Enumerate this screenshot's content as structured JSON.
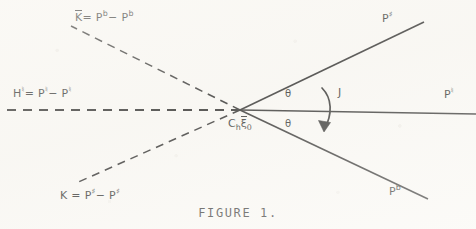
{
  "figure": {
    "caption": "FIGURE 1.",
    "ink_color": "#1a1a1a",
    "paper_color": "#fbfaf7",
    "vertex": {
      "x": 240,
      "y": 110,
      "label_c": "C",
      "label_c_sub": "h",
      "label_xi": "ξ",
      "label_xi_sub": "0"
    },
    "angles": [
      {
        "name": "theta-upper",
        "symbol": "θ"
      },
      {
        "name": "theta-lower",
        "symbol": "θ"
      }
    ],
    "rotation_arrow": {
      "label": "J"
    },
    "equations": {
      "k_tilde": {
        "lhs": "K",
        "accent": "tilde",
        "eq": "=",
        "term1_base": "P",
        "term1_sup": "b",
        "minus": "−",
        "term2_base": "P",
        "term2_sup": "b"
      },
      "h_natural": {
        "lhs": "H",
        "lhs_sup": "♮",
        "eq": "=",
        "term1_base": "P",
        "term1_sup": "♮",
        "minus": "−",
        "term2_base": "P",
        "term2_sup": "♮"
      },
      "k_sharp": {
        "lhs": "K",
        "eq": "=",
        "term1_base": "P",
        "term1_sup": "♯",
        "minus": "−",
        "term2_base": "P",
        "term2_sup": "♯"
      }
    },
    "ray_labels": {
      "upper_right": {
        "base": "P",
        "sup": "♯"
      },
      "right": {
        "base": "P",
        "sup": "♮"
      },
      "lower_right": {
        "base": "P",
        "sup": "b"
      }
    }
  }
}
